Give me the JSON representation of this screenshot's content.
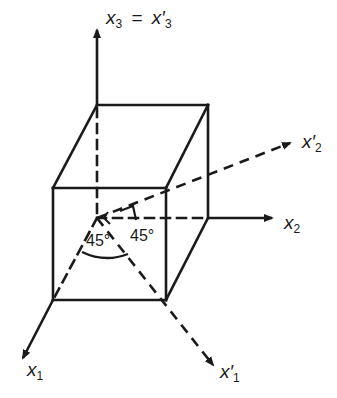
{
  "diagram": {
    "type": "coordinate rotation about x3 axis",
    "axes": {
      "x3_label": "x",
      "x3_sub": "3",
      "equals": "=",
      "x3p_label": "x′",
      "x3p_sub": "3",
      "x2_label": "x",
      "x2_sub": "2",
      "x2p_label": "x′",
      "x2p_sub": "2",
      "x1_label": "x",
      "x1_sub": "1",
      "x1p_label": "x′",
      "x1p_sub": "1"
    },
    "angles": {
      "angle_left": "45°",
      "angle_right": "45°"
    },
    "colors": {
      "stroke": "#1a1a1a",
      "background": "#ffffff"
    }
  }
}
